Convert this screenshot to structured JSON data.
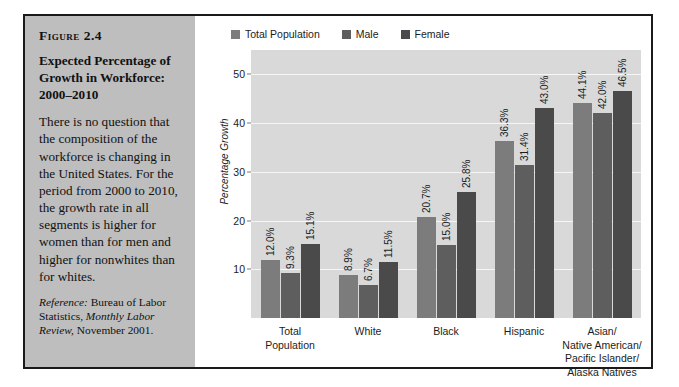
{
  "figure": {
    "number_label": "Figure 2.4",
    "title": "Expected Percentage of Growth in Workforce: 2000–2010",
    "body": "There is no question that the composition of the workforce is changing in the United States. For the period from 2000 to 2010, the growth rate in all segments is higher for women than for men and higher for nonwhites than for whites.",
    "reference_label": "Reference:",
    "reference_text_1": " Bureau of Labor Statistics, ",
    "reference_italic": "Monthly Labor Review,",
    "reference_text_2": " November 2001."
  },
  "colors": {
    "panel_bg": "#bebebe",
    "plot_bg": "#d9d9d9",
    "gridline": "#f5f5f5",
    "frame_border": "#1a1a1a",
    "series_total": "#7c7c7c",
    "series_male": "#5e5e5e",
    "series_female": "#4a4a4a",
    "axis": "#6e6e6e"
  },
  "chart_data": {
    "type": "bar",
    "title": "Expected Percentage of Growth in Workforce: 2000–2010",
    "xlabel": "",
    "ylabel": "Percentage Growth",
    "ylim": [
      0,
      55
    ],
    "yticks": [
      10,
      20,
      30,
      40,
      50
    ],
    "ytick_labels": [
      "10",
      "20",
      "30",
      "40",
      "50"
    ],
    "grid": true,
    "legend_position": "top-left",
    "categories": [
      "Total Population",
      "White",
      "Black",
      "Hispanic",
      "Asian/ Native American/ Pacific Islander/ Alaska Natives"
    ],
    "category_lines": [
      [
        "Total",
        "Population"
      ],
      [
        "White"
      ],
      [
        "Black"
      ],
      [
        "Hispanic"
      ],
      [
        "Asian/",
        "Native American/",
        "Pacific Islander/",
        "Alaska Natives"
      ]
    ],
    "series": [
      {
        "name": "Total Population",
        "color": "#7c7c7c",
        "values": [
          12.0,
          8.9,
          20.7,
          36.3,
          44.1
        ],
        "labels": [
          "12.0%",
          "8.9%",
          "20.7%",
          "36.3%",
          "44.1%"
        ]
      },
      {
        "name": "Male",
        "color": "#5e5e5e",
        "values": [
          9.3,
          6.7,
          15.0,
          31.4,
          42.0
        ],
        "labels": [
          "9.3%",
          "6.7%",
          "15.0%",
          "31.4%",
          "42.0%"
        ]
      },
      {
        "name": "Female",
        "color": "#4a4a4a",
        "values": [
          15.1,
          11.5,
          25.8,
          43.0,
          46.5
        ],
        "labels": [
          "15.1%",
          "11.5%",
          "25.8%",
          "43.0%",
          "46.5%"
        ]
      }
    ]
  }
}
